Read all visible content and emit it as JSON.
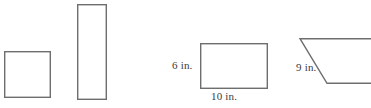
{
  "figure_set": {
    "title": "Geometric figures: square, rectangle, labeled rectangle, trapezoid",
    "background_color": "#ffffff",
    "stroke_color": "#6e6e6e",
    "label_color": "#3a3a3a",
    "stroke_width": 1.4,
    "units": "in.",
    "shapes": [
      {
        "id": "small-square",
        "name": "square",
        "type": "rect",
        "x": 4,
        "y": 51,
        "width": 46,
        "height": 46,
        "labels": []
      },
      {
        "id": "tall-rectangle",
        "name": "tall-rectangle",
        "type": "rect",
        "x": 77,
        "y": 4,
        "width": 29,
        "height": 95,
        "labels": []
      },
      {
        "id": "labeled-rectangle",
        "name": "labeled-rectangle",
        "type": "rect",
        "x": 200,
        "y": 43,
        "width": 67,
        "height": 45,
        "labels": [
          {
            "id": "height-6",
            "text": "6 in.",
            "value": 6,
            "side": "left"
          },
          {
            "id": "width-10",
            "text": "10 in.",
            "value": 10,
            "side": "bottom"
          }
        ]
      },
      {
        "id": "trapezoid",
        "name": "trapezoid",
        "type": "polygon",
        "clipped_at_right_edge": true,
        "points": "300,38 371,38 371,83 327,83",
        "labels": [
          {
            "id": "slant-9",
            "text": "9 in.",
            "value": 9,
            "side": "slant"
          }
        ]
      }
    ],
    "labels": {
      "height_6": "6 in.",
      "width_10": "10 in.",
      "slant_9": "9 in."
    }
  }
}
